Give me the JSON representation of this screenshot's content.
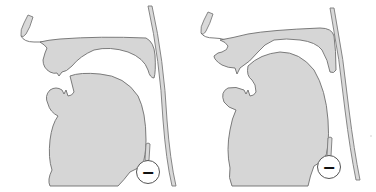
{
  "figure": {
    "type": "midsagittal vocal tract diagrams",
    "panels": [
      {
        "id": "left",
        "voicing_symbol": "−",
        "voicing": "voiceless"
      },
      {
        "id": "right",
        "voicing_symbol": "−",
        "voicing": "voiceless"
      }
    ],
    "colors": {
      "tissue_fill": "#d6d6d6",
      "outline": "#6e6e6e",
      "background": "#ffffff"
    }
  }
}
